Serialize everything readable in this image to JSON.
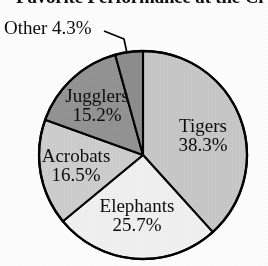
{
  "chart_data": {
    "type": "pie",
    "title": "Favorite Performance at the Ci",
    "title_note": "clipped at top and right edge of image",
    "xlabel": "",
    "ylabel": "",
    "legend": "none",
    "grid": false,
    "start_angle_deg": 0,
    "direction": "clockwise",
    "categories": [
      "Tigers",
      "Elephants",
      "Acrobats",
      "Jugglers",
      "Other"
    ],
    "values": [
      38.3,
      25.7,
      16.5,
      15.2,
      4.3
    ],
    "unit": "%",
    "total": 100.0,
    "slices": [
      {
        "name": "Tigers",
        "value": 38.3,
        "label": "Tigers",
        "pct_label": "38.3%",
        "color": "#c9c9c9",
        "label_position": "inside"
      },
      {
        "name": "Elephants",
        "value": 25.7,
        "label": "Elephants",
        "pct_label": "25.7%",
        "color": "#f2f2f2",
        "label_position": "inside"
      },
      {
        "name": "Acrobats",
        "value": 16.5,
        "label": "Acrobats",
        "pct_label": "16.5%",
        "color": "#cfcfcf",
        "label_position": "inside"
      },
      {
        "name": "Jugglers",
        "value": 15.2,
        "label": "Jugglers",
        "pct_label": "15.2%",
        "color": "#949494",
        "label_position": "inside"
      },
      {
        "name": "Other",
        "value": 4.3,
        "label": "Other",
        "pct_label": "4.3%",
        "color": "#8e8e8e",
        "label_position": "outside-callout"
      }
    ],
    "outline_color": "#000000",
    "background": "#ffffff"
  },
  "labels": {
    "other": "Other 4.3%",
    "tigers_name": "Tigers",
    "tigers_pct": "38.3%",
    "elephants_name": "Elephants",
    "elephants_pct": "25.7%",
    "acrobats_name": "Acrobats",
    "acrobats_pct": "16.5%",
    "jugglers_name": "Jugglers",
    "jugglers_pct": "15.2%"
  }
}
